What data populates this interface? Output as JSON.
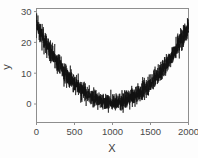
{
  "chart_data": {
    "type": "line",
    "title": "",
    "subtitle": "",
    "xlabel": "X",
    "ylabel": "y",
    "xlim": [
      0,
      2000
    ],
    "ylim": [
      -6,
      31
    ],
    "grid": false,
    "legend": null,
    "xticks": [
      0,
      500,
      1000,
      1500,
      2000
    ],
    "xtick_labels": [
      "0",
      "500",
      "1000",
      "1500",
      "2000"
    ],
    "yticks": [
      0,
      10,
      20,
      30
    ],
    "ytick_labels": [
      "0",
      "10",
      "20",
      "30"
    ],
    "series": [
      {
        "name": "y",
        "color": "#111111",
        "trend_model": "quadratic",
        "trend_vertex_x": 1000,
        "trend_vertex_y": 0.5,
        "trend_value_at_x0": 25.5,
        "trend_value_at_x2000": 25.5,
        "noise_amplitude": 2.6,
        "n_points": 2000,
        "approx_points": [
          {
            "x": 0,
            "y": 25.5
          },
          {
            "x": 100,
            "y": 21.0
          },
          {
            "x": 200,
            "y": 17.0
          },
          {
            "x": 300,
            "y": 13.5
          },
          {
            "x": 400,
            "y": 10.2
          },
          {
            "x": 500,
            "y": 7.0
          },
          {
            "x": 600,
            "y": 4.6
          },
          {
            "x": 700,
            "y": 2.8
          },
          {
            "x": 800,
            "y": 1.5
          },
          {
            "x": 900,
            "y": 0.8
          },
          {
            "x": 1000,
            "y": 0.5
          },
          {
            "x": 1100,
            "y": 0.8
          },
          {
            "x": 1200,
            "y": 1.5
          },
          {
            "x": 1300,
            "y": 2.8
          },
          {
            "x": 1400,
            "y": 4.6
          },
          {
            "x": 1500,
            "y": 7.0
          },
          {
            "x": 1600,
            "y": 10.2
          },
          {
            "x": 1700,
            "y": 13.5
          },
          {
            "x": 1800,
            "y": 17.0
          },
          {
            "x": 1900,
            "y": 21.0
          },
          {
            "x": 2000,
            "y": 25.5
          }
        ]
      }
    ]
  },
  "figure": {
    "background_color": "#fdfdfd",
    "frame_color": "#8e8e8e",
    "text_color": "#4a4a4a",
    "data_color": "#111111"
  }
}
